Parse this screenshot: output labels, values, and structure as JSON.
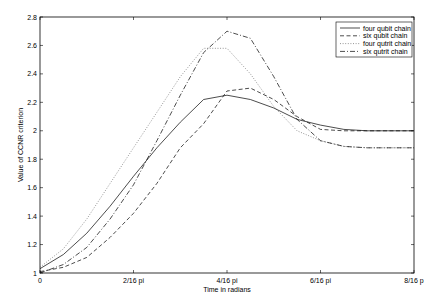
{
  "chart_data": {
    "type": "line",
    "title": "",
    "xlabel": "Time in radians",
    "ylabel": "Value of CCNR criterion",
    "xlim": [
      0,
      8
    ],
    "ylim": [
      1,
      2.8
    ],
    "x_unit_note": "x in units of 1/16 pi",
    "xticks": [
      0,
      2,
      4,
      6,
      8
    ],
    "xtick_labels": [
      "0",
      "2/16 pi",
      "4/16 pi",
      "6/16 pi",
      "8/16 p"
    ],
    "yticks": [
      1,
      1.2,
      1.4,
      1.6,
      1.8,
      2,
      2.2,
      2.4,
      2.6,
      2.8
    ],
    "ytick_labels": [
      "1",
      "1.2",
      "1.4",
      "1.6",
      "1.8",
      "2",
      "2.2",
      "2.4",
      "2.6",
      "2.8"
    ],
    "grid": false,
    "legend_position": "top-right",
    "x": [
      0,
      0.5,
      1,
      1.5,
      2,
      2.5,
      3,
      3.5,
      4,
      4.5,
      5,
      5.5,
      6,
      6.5,
      7,
      8
    ],
    "series": [
      {
        "name": "four qubit chain",
        "style": "solid",
        "color": "#000000",
        "values": [
          1.03,
          1.13,
          1.28,
          1.47,
          1.68,
          1.88,
          2.06,
          2.22,
          2.25,
          2.22,
          2.16,
          2.08,
          2.04,
          2.01,
          2.0,
          2.0
        ]
      },
      {
        "name": "six qubit chain",
        "style": "dashed",
        "color": "#000000",
        "values": [
          1.01,
          1.04,
          1.11,
          1.25,
          1.42,
          1.63,
          1.88,
          2.05,
          2.28,
          2.3,
          2.22,
          2.1,
          2.01,
          2.0,
          2.0,
          2.0
        ]
      },
      {
        "name": "four qutrit chain",
        "style": "dotted",
        "color": "#000000",
        "values": [
          1.04,
          1.17,
          1.38,
          1.63,
          1.88,
          2.13,
          2.38,
          2.58,
          2.58,
          2.4,
          2.17,
          2.0,
          1.93,
          1.89,
          1.88,
          1.88
        ]
      },
      {
        "name": "six qutrit chain",
        "style": "dashdot",
        "color": "#000000",
        "values": [
          1.0,
          1.06,
          1.18,
          1.38,
          1.62,
          1.93,
          2.25,
          2.55,
          2.7,
          2.65,
          2.38,
          2.08,
          1.93,
          1.89,
          1.88,
          1.88
        ]
      }
    ]
  }
}
